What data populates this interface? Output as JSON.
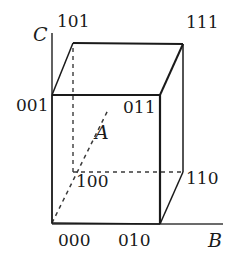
{
  "figure": {
    "type": "cube-diagram",
    "stroke_color": "#1a1a1a",
    "text_color": "#1a1a1a",
    "background_color": "#ffffff"
  },
  "axes": [
    {
      "name": "A",
      "label": "A",
      "style": "dashed",
      "direction": "depth"
    },
    {
      "name": "B",
      "label": "B",
      "style": "solid",
      "direction": "horizontal"
    },
    {
      "name": "C",
      "label": "C",
      "style": "solid",
      "direction": "vertical"
    }
  ],
  "vertices": [
    {
      "code": "000",
      "label": "000",
      "x": 52,
      "y": 223,
      "hidden": false,
      "label_x": 58,
      "label_y": 232
    },
    {
      "code": "010",
      "label": "010",
      "x": 160,
      "y": 224,
      "hidden": false,
      "label_x": 118,
      "label_y": 232
    },
    {
      "code": "110",
      "label": "110",
      "x": 183,
      "y": 172,
      "hidden": false,
      "label_x": 186,
      "label_y": 170
    },
    {
      "code": "100",
      "label": "100",
      "x": 73,
      "y": 172,
      "hidden": true,
      "label_x": 76,
      "label_y": 173
    },
    {
      "code": "001",
      "label": "001",
      "x": 52,
      "y": 95,
      "hidden": false,
      "label_x": 16,
      "label_y": 97
    },
    {
      "code": "011",
      "label": "011",
      "x": 160,
      "y": 95,
      "hidden": false,
      "label_x": 123,
      "label_y": 99
    },
    {
      "code": "111",
      "label": "111",
      "x": 183,
      "y": 44,
      "hidden": false,
      "label_x": 186,
      "label_y": 14
    },
    {
      "code": "101",
      "label": "101",
      "x": 73,
      "y": 43,
      "hidden": false,
      "label_x": 57,
      "label_y": 13
    }
  ],
  "axis_labels": {
    "a_label": "A",
    "a_label_x": 95,
    "a_label_y": 123,
    "b_label": "B",
    "b_label_x": 208,
    "b_label_y": 231,
    "c_label": "C",
    "c_label_x": 33,
    "c_label_y": 25
  },
  "edges": [
    {
      "from": "000",
      "to": "010",
      "style": "solid"
    },
    {
      "from": "001",
      "to": "011",
      "style": "solid"
    },
    {
      "from": "011",
      "to": "010",
      "style": "solid"
    },
    {
      "from": "001",
      "to": "000",
      "style": "solid"
    },
    {
      "from": "101",
      "to": "111",
      "style": "solid"
    },
    {
      "from": "111",
      "to": "110",
      "style": "solid"
    },
    {
      "from": "001",
      "to": "101",
      "style": "solid"
    },
    {
      "from": "011",
      "to": "111",
      "style": "solid"
    },
    {
      "from": "010",
      "to": "110",
      "style": "solid"
    },
    {
      "from": "100",
      "to": "110",
      "style": "dashed"
    },
    {
      "from": "100",
      "to": "101",
      "style": "dashed"
    },
    {
      "from": "000",
      "to": "100",
      "style": "dashed"
    }
  ]
}
